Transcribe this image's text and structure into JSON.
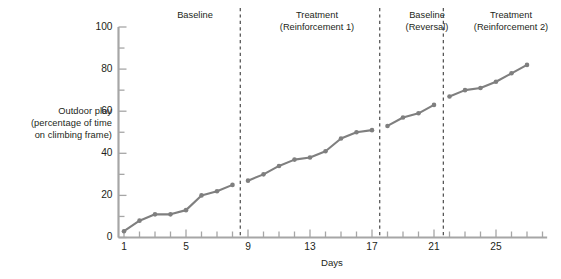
{
  "figure": {
    "y_axis_caption_lines": [
      "Outdoor play",
      "(percentage of time",
      "on climbing frame)"
    ],
    "y_axis_caption": "Outdoor play (percentage of time on climbing frame)",
    "x_axis_title": "Days"
  },
  "phases": [
    {
      "line1": "Baseline",
      "line2": ""
    },
    {
      "line1": "Treatment",
      "line2": "(Reinforcement 1)"
    },
    {
      "line1": "Baseline",
      "line2": "(Reversal)"
    },
    {
      "line1": "Treatment",
      "line2": "(Reinforcement 2)"
    }
  ],
  "colors": {
    "line": "#7f7f7f",
    "marker": "#7f7f7f",
    "axis": "#a6a6a6",
    "divider": "#3a3a3a",
    "text": "#231f20"
  },
  "chart_data": {
    "type": "line",
    "title": "",
    "xlabel": "Days",
    "ylabel": "Outdoor play (percentage of time on climbing frame)",
    "xlim": [
      0,
      28.6
    ],
    "ylim": [
      0,
      100
    ],
    "x_ticks_labeled": [
      1,
      5,
      9,
      13,
      17,
      21,
      25
    ],
    "x_ticks_minor_step": 1,
    "y_ticks_labeled": [
      0,
      20,
      40,
      60,
      80,
      100
    ],
    "y_ticks_minor_step": 10,
    "grid": false,
    "legend": "none",
    "marker": "circle",
    "phase_dividers_x": [
      8.5,
      17.5,
      21.6
    ],
    "phase_segments": [
      {
        "name": "Baseline",
        "x_range": [
          1,
          8
        ]
      },
      {
        "name": "Treatment (Reinforcement 1)",
        "x_range": [
          9,
          17
        ]
      },
      {
        "name": "Baseline (Reversal)",
        "x_range": [
          18,
          21
        ]
      },
      {
        "name": "Treatment (Reinforcement 2)",
        "x_range": [
          22,
          27
        ]
      }
    ],
    "series": [
      {
        "name": "Outdoor play",
        "x": [
          1,
          2,
          3,
          4,
          5,
          6,
          7,
          8,
          9,
          10,
          11,
          12,
          13,
          14,
          15,
          16,
          17,
          18,
          19,
          20,
          21,
          22,
          23,
          24,
          25,
          26,
          27
        ],
        "values": [
          3,
          8,
          11,
          11,
          13,
          20,
          22,
          25,
          27,
          30,
          34,
          37,
          38,
          41,
          47,
          50,
          51,
          53,
          57,
          59,
          63,
          67,
          70,
          71,
          74,
          78,
          82
        ]
      }
    ]
  }
}
